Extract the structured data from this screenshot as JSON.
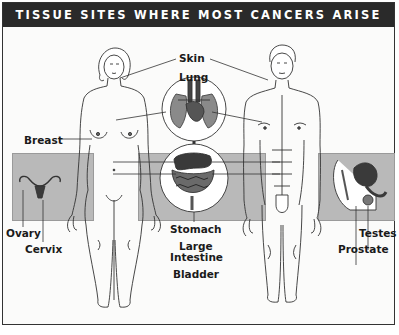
{
  "title": "TISSUE SITES WHERE MOST CANCERS ARISE",
  "labels": {
    "skin": "Skin",
    "lung": "Lung",
    "breast": "Breast",
    "ovary": "Ovary",
    "cervix": "Cervix",
    "stomach": "Stomach",
    "large_intestine_line1": "Large",
    "large_intestine_line2": "Intestine",
    "bladder": "Bladder",
    "testes": "Testes",
    "prostate": "Prostate"
  },
  "figures": {
    "female": "female-body-outline",
    "male": "male-body-outline",
    "insets": [
      "lung-heart-inset",
      "digestive-tract-inset",
      "uterus-ovaries-inset",
      "male-pelvis-inset"
    ]
  },
  "colors": {
    "title_bg": "#2a2a2a",
    "band": "#b9b9b9",
    "line": "#333333",
    "organ_dark": "#3a3a3a"
  }
}
